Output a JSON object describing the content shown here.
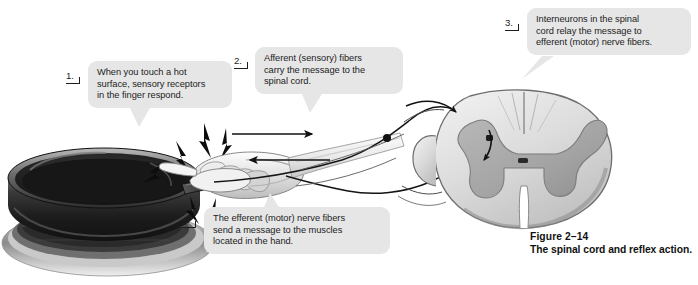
{
  "figure": {
    "title": "The spinal cord and reflex action.",
    "number_label": "Figure 2–14",
    "alt": "Illustration of a reflex arc: a hand touching a hot frying pan, nerve pathways to a spinal cord cross-section"
  },
  "callouts": [
    {
      "id": "callout-1",
      "marker": "1.",
      "text": "When you touch a hot surface, sensory receptors in the finger respond.",
      "lines": [
        "When you touch a hot",
        "surface, sensory receptors",
        "in the finger respond."
      ],
      "tail": "bottom"
    },
    {
      "id": "callout-2",
      "marker": "2.",
      "text": "Afferent (sensory) fibers carry the message to the spinal cord.",
      "lines": [
        "Afferent (sensory) fibers",
        "carry the message to the",
        "spinal cord."
      ],
      "tail": "bottom"
    },
    {
      "id": "callout-3",
      "marker": "3.",
      "text": "Interneurons in the spinal cord relay the message to efferent (motor) nerve fibers.",
      "lines": [
        "Interneurons in the spinal",
        "cord relay the message to",
        "efferent (motor) nerve fibers."
      ],
      "tail": "bottom-left"
    },
    {
      "id": "callout-4",
      "marker": "4.",
      "text": "The efferent (motor) nerve fibers send a message to the muscles located in the hand.",
      "lines": [
        "The efferent (motor) nerve fibers",
        "send a message to the muscles",
        "located in the hand."
      ],
      "tail": "top"
    }
  ],
  "artwork_parts": [
    {
      "name": "frying-pan",
      "description": "dark cast-iron skillet with handle on a stove burner"
    },
    {
      "name": "stove-burner",
      "description": "round burner rings beneath the pan"
    },
    {
      "name": "pain-flash",
      "description": "lightning bolt flash marks where the finger touches the hot pan"
    },
    {
      "name": "hand",
      "description": "hand gripping the pan handle"
    },
    {
      "name": "forearm",
      "description": "forearm extending toward the spinal cord"
    },
    {
      "name": "afferent-arrow",
      "description": "arrow pointing toward the spinal cord"
    },
    {
      "name": "efferent-arrow",
      "description": "arrow pointing back toward the hand"
    },
    {
      "name": "dorsal-root-ganglion",
      "description": "dark dot on the sensory nerve root"
    },
    {
      "name": "spinal-cord-cross-section",
      "description": "spinal cord cross-section with butterfly-shaped gray matter"
    },
    {
      "name": "interneuron-arrow",
      "description": "arrow inside the gray matter showing the relay"
    },
    {
      "name": "spinal-nerve-roots",
      "description": "nerve fibers entering and leaving the spinal cord"
    }
  ],
  "colors": {
    "bubble_bg": "#e6e6e6",
    "text": "#1d1d1d",
    "cord_outer": "#d8d8d8",
    "cord_gray_matter": "#a9a9a9",
    "pan_dark": "#2b2b2b",
    "line": "#141414"
  }
}
